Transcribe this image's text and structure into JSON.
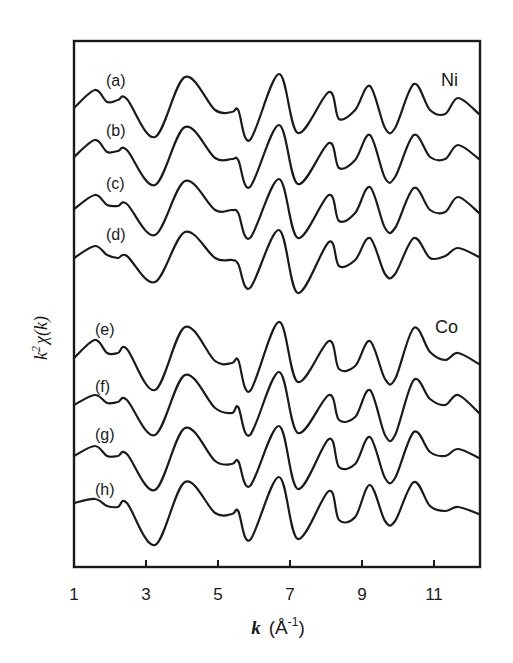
{
  "chart_data": {
    "type": "line",
    "title": "",
    "xlabel": "k (Å⁻¹)",
    "xlabel_parts": {
      "var": "k",
      "unit": "(Å",
      "exp": "-1",
      "close": ")"
    },
    "ylabel": "k²χ(k)",
    "ylabel_parts": {
      "k": "k",
      "exp": "2",
      "chi": "χ(k)"
    },
    "xlim": [
      1,
      12.3
    ],
    "xticks": [
      1,
      3,
      5,
      7,
      9,
      11
    ],
    "xtick_labels": [
      "1",
      "3",
      "5",
      "7",
      "9",
      "11"
    ],
    "yticks": [],
    "grid": false,
    "legend": "none",
    "group_labels": [
      {
        "text": "Ni",
        "near_series": "a"
      },
      {
        "text": "Co",
        "near_series": "e"
      }
    ],
    "note": "Curves are vertically offset EXAFS spectra; y values are relative amplitude (arbitrary units, offset baseline added per series).",
    "x": [
      1.0,
      1.58,
      1.92,
      2.22,
      2.47,
      3.25,
      4.08,
      4.92,
      5.39,
      5.56,
      5.89,
      6.69,
      7.22,
      8.08,
      8.36,
      8.81,
      9.22,
      9.64,
      9.92,
      10.44,
      10.89,
      11.31,
      11.67,
      12.25
    ],
    "series": [
      {
        "name": "(a)",
        "group": "Ni",
        "offset": 108,
        "values": [
          0,
          18,
          6,
          8,
          9,
          -29,
          31,
          -2,
          -4,
          -2,
          -32,
          34,
          -25,
          16,
          -11,
          -2,
          22,
          -20,
          -20,
          24,
          -2,
          -6,
          10,
          -6
        ]
      },
      {
        "name": "(b)",
        "group": "Ni",
        "offset": 157,
        "values": [
          0,
          17,
          5,
          6,
          7,
          -28,
          30,
          -1,
          -2,
          -3,
          -30,
          32,
          -27,
          14,
          -11,
          -3,
          22,
          -21,
          -20,
          22,
          0,
          -2,
          12,
          -2
        ]
      },
      {
        "name": "(c)",
        "group": "Ni",
        "offset": 209,
        "values": [
          0,
          14,
          4,
          3,
          5,
          -26,
          28,
          -1,
          -1,
          -4,
          -29,
          30,
          -29,
          14,
          -12,
          -4,
          22,
          -19,
          -19,
          21,
          -1,
          -3,
          12,
          -4
        ]
      },
      {
        "name": "(d)",
        "group": "Ni",
        "offset": 258,
        "values": [
          0,
          12,
          3,
          0,
          2,
          -24,
          26,
          0,
          -2,
          -6,
          -30,
          28,
          -35,
          16,
          -8,
          -2,
          20,
          -16,
          -16,
          20,
          0,
          2,
          10,
          1
        ]
      },
      {
        "name": "(e)",
        "group": "Co",
        "offset": 358,
        "values": [
          0,
          18,
          5,
          5,
          9,
          -32,
          31,
          -3,
          -5,
          -2,
          -33,
          36,
          -24,
          17,
          -11,
          -8,
          17,
          -21,
          -21,
          30,
          6,
          -2,
          5,
          -6
        ]
      },
      {
        "name": "(f)",
        "group": "Co",
        "offset": 405,
        "values": [
          0,
          10,
          2,
          3,
          5,
          -30,
          30,
          -3,
          -8,
          -2,
          -30,
          33,
          -28,
          10,
          -15,
          -12,
          15,
          -30,
          -30,
          25,
          6,
          0,
          10,
          -8
        ]
      },
      {
        "name": "(g)",
        "group": "Co",
        "offset": 456,
        "values": [
          0,
          10,
          0,
          0,
          2,
          -34,
          28,
          -5,
          -8,
          -5,
          -30,
          30,
          -33,
          17,
          -11,
          -8,
          19,
          -22,
          -22,
          24,
          4,
          0,
          7,
          -2
        ]
      },
      {
        "name": "(h)",
        "group": "Co",
        "offset": 503,
        "values": [
          0,
          4,
          -3,
          -4,
          0,
          -42,
          21,
          -10,
          -11,
          -8,
          -37,
          26,
          -36,
          12,
          -17,
          -14,
          18,
          -18,
          -18,
          21,
          -3,
          -8,
          -4,
          -11
        ]
      }
    ]
  },
  "labels": {
    "a": "(a)",
    "b": "(b)",
    "c": "(c)",
    "d": "(d)",
    "e": "(e)",
    "f": "(f)",
    "g": "(g)",
    "h": "(h)",
    "ni": "Ni",
    "co": "Co"
  },
  "style": {
    "line_color": "#1a1a1a",
    "background": "#ffffff"
  }
}
